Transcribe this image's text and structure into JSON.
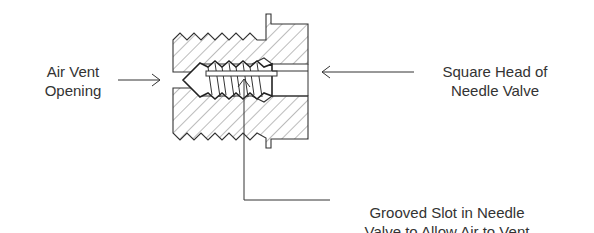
{
  "diagram": {
    "colors": {
      "line": "#333333",
      "hatch": "#777777",
      "background": "#ffffff"
    },
    "labels": {
      "air_vent": {
        "line1": "Air Vent",
        "line2": "Opening"
      },
      "square_head": {
        "line1": "Square Head of",
        "line2": "Needle Valve"
      },
      "grooved_slot": {
        "line1": "Grooved Slot in Needle",
        "line2": "Valve to Allow Air to Vent"
      }
    },
    "callouts": [
      {
        "name": "air-vent-arrow",
        "direction": "right"
      },
      {
        "name": "square-head-arrow",
        "direction": "left"
      },
      {
        "name": "grooved-slot-leader",
        "direction": "up"
      }
    ]
  }
}
